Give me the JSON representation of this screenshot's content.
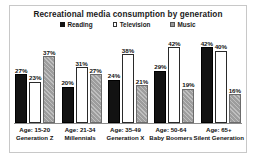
{
  "chart_data": {
    "type": "bar",
    "title": "Recreational media consumption by generation",
    "xlabel": "",
    "ylabel": "",
    "ylim": [
      0,
      46
    ],
    "grid": false,
    "legend_position": "top-center",
    "categories": [
      "Age: 15-20",
      "Age: 21-34",
      "Age: 35-49",
      "Age: 50-64",
      "Age: 65+"
    ],
    "category_sublabels": [
      "Generation Z",
      "Millennials",
      "Generation X",
      "Baby Boomers",
      "Silent Generation"
    ],
    "series": [
      {
        "name": "Reading",
        "color": "#121212",
        "style": "solid",
        "values": [
          27,
          20,
          24,
          29,
          42
        ],
        "labels": [
          "27%",
          "20%",
          "24%",
          "29%",
          "42%"
        ]
      },
      {
        "name": "Television",
        "color": "#ffffff",
        "style": "outline",
        "values": [
          23,
          31,
          38,
          42,
          40
        ],
        "labels": [
          "23%",
          "31%",
          "38%",
          "42%",
          "40%"
        ]
      },
      {
        "name": "Music",
        "color": "#9d9d9d",
        "style": "hatched",
        "values": [
          37,
          27,
          21,
          19,
          16
        ],
        "labels": [
          "37%",
          "27%",
          "21%",
          "19%",
          "16%"
        ]
      }
    ]
  },
  "legend": {
    "items": [
      {
        "label": "Reading",
        "swatch": "solid-square-icon"
      },
      {
        "label": "Television",
        "swatch": "outline-square-icon"
      },
      {
        "label": "Music",
        "swatch": "hatched-square-icon"
      }
    ]
  }
}
